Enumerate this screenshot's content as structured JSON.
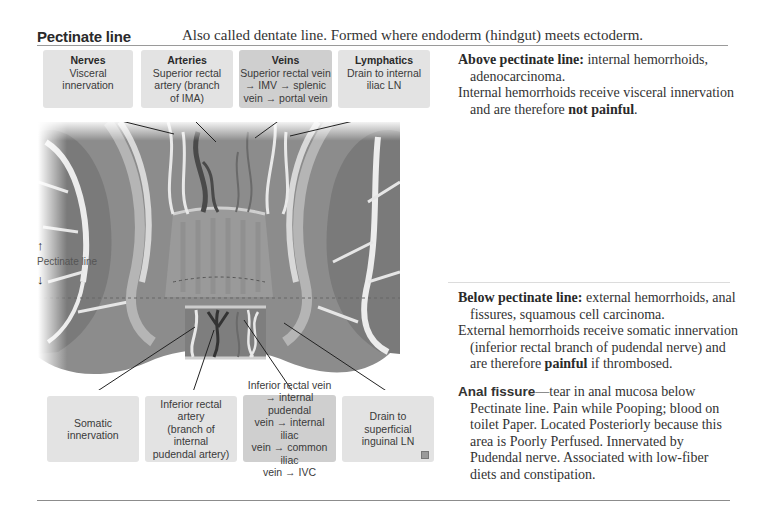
{
  "header": {
    "title": "Pectinate line",
    "description": "Also called dentate line. Formed where endoderm (hindgut) meets ectoderm."
  },
  "top_boxes": [
    {
      "title": "Nerves",
      "body": "Visceral innervation"
    },
    {
      "title": "Arteries",
      "body": "Superior rectal\nartery (branch\nof IMA)"
    },
    {
      "title": "Veins",
      "body": "Superior rectal vein\n→ IMV  → splenic\nvein → portal vein"
    },
    {
      "title": "Lymphatics",
      "body": "Drain to internal\niliac LN"
    }
  ],
  "bottom_boxes": [
    {
      "body": "Somatic innervation"
    },
    {
      "body": "Inferior rectal artery\n(branch of internal\npudendal artery)"
    },
    {
      "body": "Inferior rectal vein\n→ internal pudendal\nvein → internal iliac\nvein → common iliac\nvein → IVC"
    },
    {
      "body": "Drain to superficial\ninguinal LN"
    }
  ],
  "illustration": {
    "pectinate_label": "Pectinate line",
    "arrow_up": "↑",
    "arrow_down": "↓"
  },
  "right_column": {
    "above": {
      "term": "Above pectinate line:",
      "text": " internal hemorrhoids, adenocarcinoma.",
      "line2_pre": "Internal hemorrhoids receive visceral innervation and are therefore ",
      "line2_bold": "not painful",
      "line2_post": "."
    },
    "below": {
      "term": "Below pectinate line:",
      "text": " external hemorrhoids, anal fissures, squamous cell carcinoma.",
      "line2_pre": "External hemorrhoids receive somatic innervation (inferior rectal branch of pudendal nerve) and are therefore ",
      "line2_bold": "painful",
      "line2_post": " if thrombosed."
    },
    "anal_fissure": {
      "term": "Anal fissure",
      "text": "—tear in anal mucosa below Pectinate line. Pain while Pooping; blood on toilet Paper. Located Posteriorly because this area is Poorly Perfused. Innervated by Pudendal nerve. Associated with low-fiber diets and constipation."
    }
  },
  "colors": {
    "box_light": "#e3e3e3",
    "box_dark": "#cfcfcf",
    "rule": "#9a9a9a"
  }
}
